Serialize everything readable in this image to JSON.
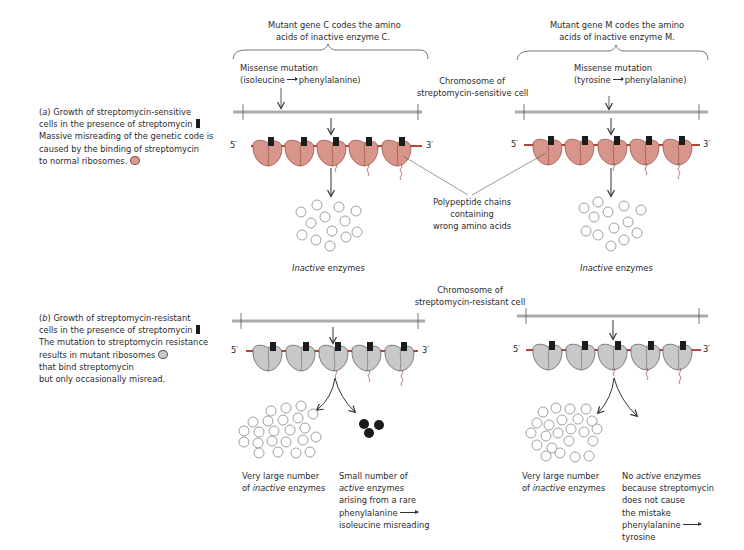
{
  "panel_a": {
    "caption": {
      "line1_prefix": "(",
      "line1_letter": "a",
      "line1_rest": ") Growth of streptomycin-sensitive",
      "line2": "cells in the presence of streptomycin",
      "line3": "Massive misreading of the genetic code is",
      "line4": "caused by the binding of streptomycin",
      "line5": "to normal ribosomes."
    },
    "gene_c_label": [
      "Mutant gene C codes the amino",
      "acids of inactive enzyme C."
    ],
    "gene_m_label": [
      "Mutant gene M codes the amino",
      "acids of inactive enzyme M."
    ],
    "missense_c": [
      "Missense mutation",
      "(isoleucine",
      "phenylalanine)"
    ],
    "missense_m": [
      "Missense mutation",
      "(tyrosine",
      "phenylalanine)"
    ],
    "chromosome_label": [
      "Chromosome of",
      "streptomycin-sensitive cell"
    ],
    "polypeptide_label": [
      "Polypeptide chains",
      "containing",
      "wrong amino acids"
    ],
    "inactive_c": {
      "italic": "Inactive",
      "rest": " enzymes"
    },
    "inactive_m": {
      "italic": "Inactive",
      "rest": " enzymes"
    },
    "five_prime": "5′",
    "three_prime": "3′"
  },
  "panel_b": {
    "caption": {
      "line1_prefix": "(",
      "line1_letter": "b",
      "line1_rest": ") Growth of streptomycin-resistant",
      "line2": "cells in the presence of streptomycin",
      "line3": "The mutation to streptomycin resistance",
      "line4": "results in mutant ribosomes",
      "line5": "that bind streptomycin",
      "line6": "but only occasionally misread."
    },
    "chromosome_label": [
      "Chromosome of",
      "streptomycin-resistant cell"
    ],
    "left_inactive": {
      "line1": "Very large number",
      "line2_pre": "of ",
      "line2_italic": "inactive",
      "line2_post": " enzymes"
    },
    "left_active": {
      "line1": "Small number of",
      "line2_italic": "active",
      "line2_post": " enzymes",
      "line3": "arising from a rare",
      "line4": "phenylalanine",
      "line5": "isoleucine misreading"
    },
    "right_inactive": {
      "line1": "Very large number",
      "line2_pre": "of ",
      "line2_italic": "inactive",
      "line2_post": " enzymes"
    },
    "right_none": {
      "line1_pre": "No ",
      "line1_italic": "active",
      "line1_post": " enzymes",
      "line2": "because streptomycin",
      "line3": "does not cause",
      "line4": "the mistake",
      "line5": "phenylalanine",
      "line6": "tyrosine"
    },
    "five_prime": "5′",
    "three_prime": "3′"
  },
  "colors": {
    "chromosome": "#a9abad",
    "mrna": "#b0493c",
    "ribosome_sensitive": "#d8958c",
    "ribosome_resistant": "#c6c8ca",
    "streptomycin": "#1c1c1c",
    "text": "#2b2b2b"
  }
}
